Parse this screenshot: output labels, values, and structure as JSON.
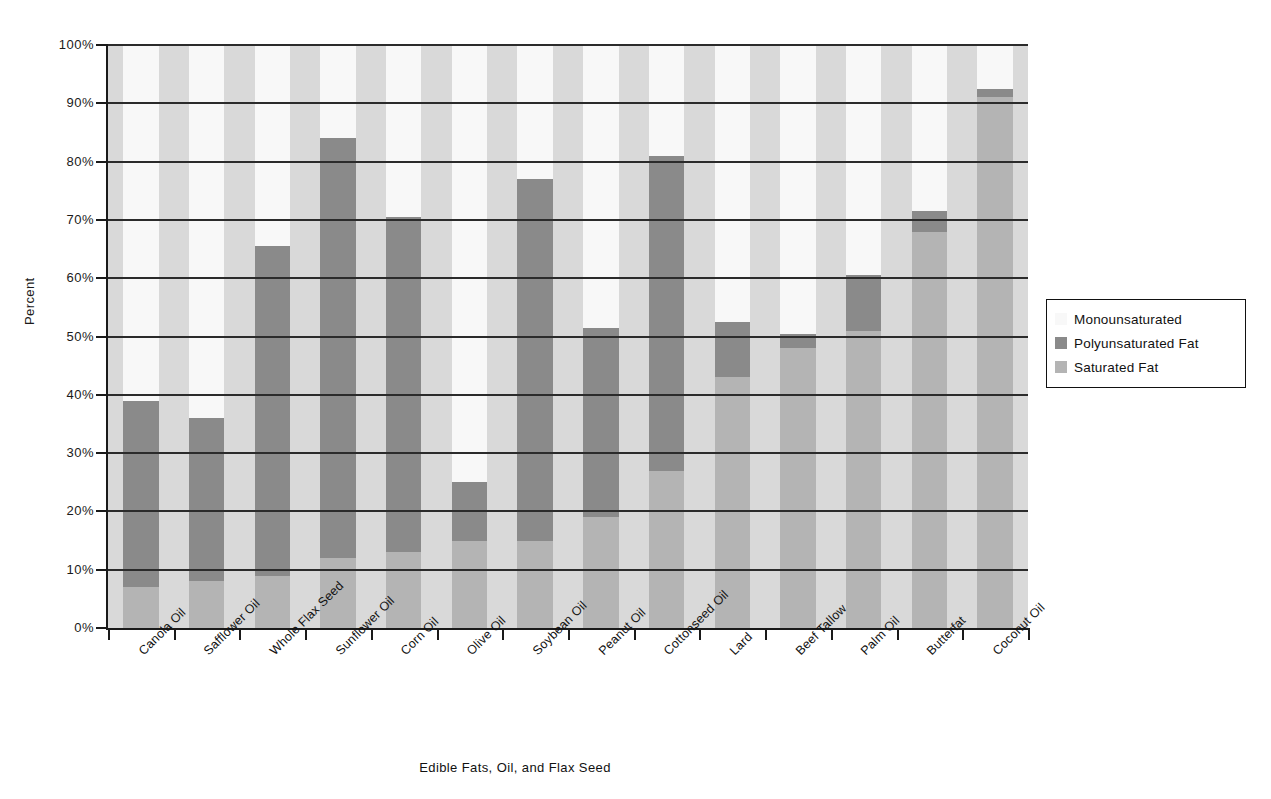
{
  "chart_data": {
    "type": "bar",
    "subtype": "stacked-bar-100-percent",
    "title": "",
    "xlabel": "Edible Fats, Oil, and Flax Seed",
    "ylabel": "Percent",
    "ylim": [
      0,
      100
    ],
    "ytick_labels": [
      "0%",
      "10%",
      "20%",
      "30%",
      "40%",
      "50%",
      "60%",
      "70%",
      "80%",
      "90%",
      "100%"
    ],
    "ytick_values": [
      0,
      10,
      20,
      30,
      40,
      50,
      60,
      70,
      80,
      90,
      100
    ],
    "grid": true,
    "legend_position": "right",
    "categories": [
      "Canola Oil",
      "Safflower Oil",
      "Whole Flax Seed",
      "Sunflower Oil",
      "Corn Oil",
      "Olive Oil",
      "Soybean Oil",
      "Peanut Oil",
      "Cottonseed Oil",
      "Lard",
      "Beef Tallow",
      "Palm Oil",
      "Butterfat",
      "Coconut Oil"
    ],
    "series": [
      {
        "name": "Saturated Fat",
        "color": "#b4b4b4",
        "values": [
          7,
          8,
          9,
          12,
          13,
          15,
          15,
          19,
          27,
          43,
          48,
          51,
          68,
          91
        ]
      },
      {
        "name": "Polyunsaturated Fat",
        "color": "#8a8a8a",
        "values": [
          32,
          28,
          56.5,
          72,
          57.5,
          10,
          62,
          32.5,
          54,
          9.5,
          2.5,
          9.5,
          3.5,
          1.5
        ]
      },
      {
        "name": "Monounsaturated",
        "color": "#f8f8f8",
        "values": [
          61,
          64,
          34.5,
          16,
          29.5,
          75,
          23,
          48.5,
          19,
          47.5,
          49.5,
          39.5,
          28.5,
          7.5
        ]
      }
    ],
    "cumulative_tops": {
      "saturated": [
        7,
        8,
        9,
        12,
        13,
        15,
        15,
        19,
        27,
        43,
        48,
        51,
        68,
        91
      ],
      "polyunsaturated": [
        39,
        36,
        65.5,
        84,
        70.5,
        25,
        77,
        51.5,
        81,
        52.5,
        50.5,
        60.5,
        71.5,
        92.5
      ],
      "monounsaturated": [
        100,
        100,
        100,
        100,
        100,
        100,
        100,
        100,
        100,
        100,
        100,
        100,
        100,
        100
      ]
    }
  },
  "legend": {
    "entries": [
      {
        "label": "Monounsaturated",
        "color": "#f8f8f8",
        "swatch": "legend-swatch-monounsaturated"
      },
      {
        "label": "Polyunsaturated Fat",
        "color": "#8a8a8a",
        "swatch": "legend-swatch-polyunsaturated"
      },
      {
        "label": "Saturated Fat",
        "color": "#b4b4b4",
        "swatch": "legend-swatch-saturated"
      }
    ]
  },
  "colors": {
    "monounsaturated": "#f8f8f8",
    "polyunsaturated": "#8a8a8a",
    "saturated": "#b4b4b4",
    "plot_background": "#d9d9d9",
    "axis": "#1a1a1a",
    "gridline": "#2b2b2b"
  }
}
